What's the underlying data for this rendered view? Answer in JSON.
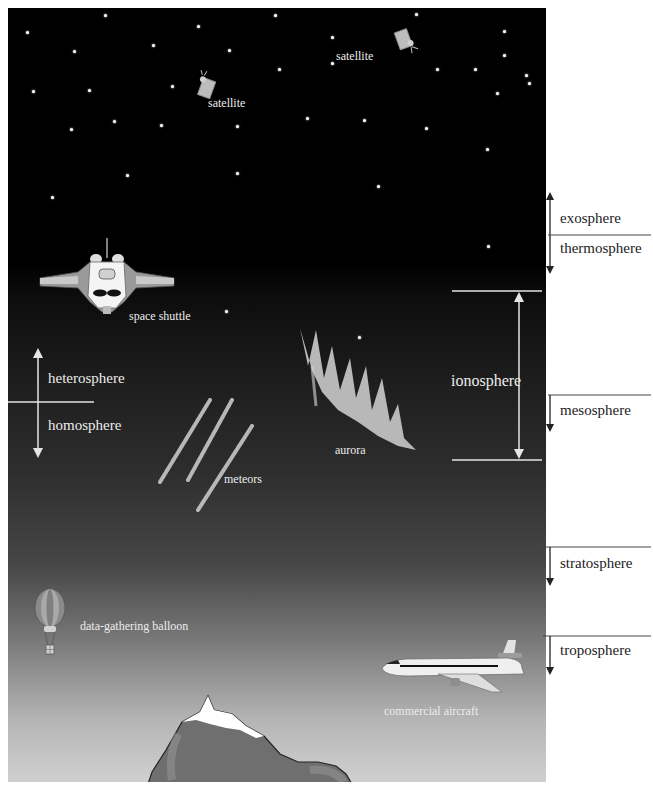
{
  "figure": {
    "colors": {
      "space": "#000000",
      "sky_low": "#d0d0d0",
      "label_on_dark": "#ececec",
      "label_on_white": "#222222",
      "mountain": "#6e6e6e",
      "snow": "#ffffff"
    }
  },
  "objects": {
    "satellite_1": "satellite",
    "satellite_2": "satellite",
    "space_shuttle": "space shuttle",
    "aurora": "aurora",
    "meteors": "meteors",
    "balloon": "data-gathering balloon",
    "aircraft": "commercial aircraft"
  },
  "layers_right": [
    {
      "name": "exosphere"
    },
    {
      "name": "thermosphere"
    },
    {
      "name": "mesosphere"
    },
    {
      "name": "stratosphere"
    },
    {
      "name": "troposphere"
    }
  ],
  "ionosphere": {
    "label": "ionosphere"
  },
  "composition": {
    "upper": "heterosphere",
    "lower": "homosphere"
  },
  "stars": [
    [
      18,
      31
    ],
    [
      72,
      14
    ],
    [
      136,
      25
    ],
    [
      189,
      14
    ],
    [
      286,
      13
    ],
    [
      347,
      30
    ],
    [
      392,
      30
    ],
    [
      228,
      36
    ],
    [
      228,
      62
    ],
    [
      105,
      44
    ],
    [
      157,
      49
    ],
    [
      50,
      50
    ],
    [
      118,
      85
    ],
    [
      192,
      68
    ],
    [
      61,
      89
    ],
    [
      22,
      90
    ],
    [
      78,
      120
    ],
    [
      48,
      128
    ],
    [
      110,
      124
    ],
    [
      163,
      125
    ],
    [
      211,
      117
    ],
    [
      250,
      119
    ],
    [
      293,
      127
    ],
    [
      335,
      148
    ],
    [
      405,
      30
    ],
    [
      347,
      54
    ],
    [
      327,
      68
    ],
    [
      362,
      74
    ],
    [
      392,
      100
    ],
    [
      408,
      76
    ],
    [
      385,
      97
    ],
    [
      364,
      82
    ],
    [
      408,
      122
    ],
    [
      402,
      155
    ],
    [
      87,
      174
    ],
    [
      163,
      172
    ],
    [
      260,
      185
    ],
    [
      35,
      196
    ],
    [
      408,
      199
    ],
    [
      301,
      68
    ],
    [
      342,
      92
    ],
    [
      440,
      204
    ],
    [
      474,
      240
    ],
    [
      336,
      245
    ],
    [
      155,
      310
    ],
    [
      247,
      336
    ]
  ]
}
